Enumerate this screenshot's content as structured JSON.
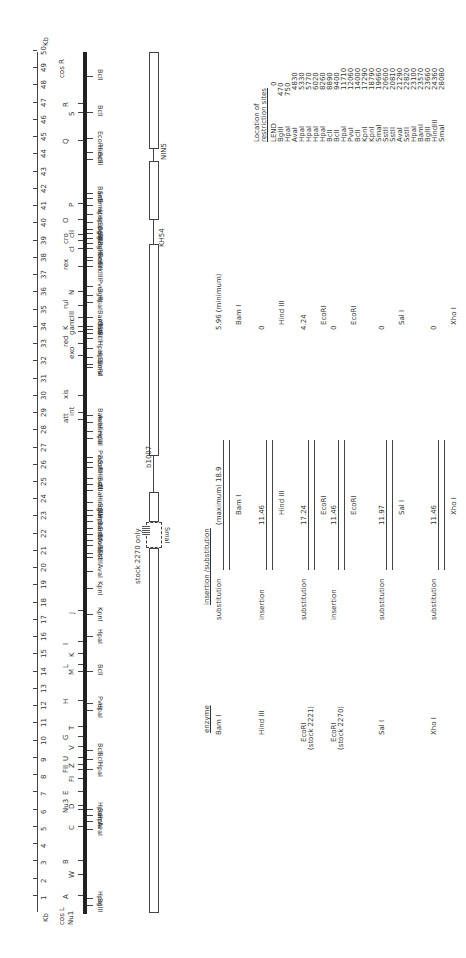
{
  "scale": {
    "unit_top": "Kb",
    "unit_bottom": "Kb",
    "ticks": [
      "1",
      "2",
      "3",
      "4",
      "5",
      "6",
      "7",
      "8",
      "9",
      "10",
      "11",
      "12",
      "13",
      "14",
      "15",
      "16",
      "17",
      "18",
      "19",
      "20",
      "21",
      "22",
      "23",
      "24",
      "25",
      "26",
      "27",
      "28",
      "29",
      "30",
      "31",
      "32",
      "33",
      "34",
      "35",
      "36",
      "37",
      "38",
      "39",
      "40",
      "41",
      "42",
      "43",
      "44",
      "45",
      "46",
      "47",
      "48",
      "49",
      "50"
    ]
  },
  "map": {
    "left_labels": [
      "cos L",
      "Nu1"
    ],
    "right_label": "cos R",
    "genes": [
      {
        "label": "A",
        "kb": 1.0
      },
      {
        "label": "W",
        "kb": 2.2
      },
      {
        "label": "B",
        "kb": 3.0
      },
      {
        "label": "C",
        "kb": 5.0
      },
      {
        "label": "Nu3",
        "kb": 6.0
      },
      {
        "label": "D",
        "kb": 6.2
      },
      {
        "label": "E",
        "kb": 7.0
      },
      {
        "label": "FI",
        "kb": 7.8
      },
      {
        "label": "FII",
        "kb": 8.3
      },
      {
        "label": "Z",
        "kb": 8.6
      },
      {
        "label": "U",
        "kb": 9.0
      },
      {
        "label": "V",
        "kb": 9.6
      },
      {
        "label": "G",
        "kb": 10.2
      },
      {
        "label": "T",
        "kb": 10.8
      },
      {
        "label": "H",
        "kb": 12.3
      },
      {
        "label": "M",
        "kb": 14.0
      },
      {
        "label": "L",
        "kb": 14.4
      },
      {
        "label": "K",
        "kb": 15.0
      },
      {
        "label": "I",
        "kb": 15.7
      },
      {
        "label": "J",
        "kb": 17.5
      },
      {
        "label": "att",
        "kb": 28.6
      },
      {
        "label": "int",
        "kb": 29.0
      },
      {
        "label": "xis",
        "kb": 30.0
      },
      {
        "label": "exo",
        "kb": 32.3
      },
      {
        "label": "red",
        "kb": 33.0
      },
      {
        "label": "gam",
        "kb": 33.7
      },
      {
        "label": "K",
        "kb": 34.0
      },
      {
        "label": "cIII",
        "kb": 34.5
      },
      {
        "label": "rul",
        "kb": 35.2
      },
      {
        "label": "N",
        "kb": 36.0
      },
      {
        "label": "rex",
        "kb": 37.5
      },
      {
        "label": "cI",
        "kb": 38.5
      },
      {
        "label": "cro",
        "kb": 39.0
      },
      {
        "label": "cII",
        "kb": 39.3
      },
      {
        "label": "O",
        "kb": 40.2
      },
      {
        "label": "P",
        "kb": 41.1
      },
      {
        "label": "Q",
        "kb": 44.8
      },
      {
        "label": "S",
        "kb": 46.4
      },
      {
        "label": "R",
        "kb": 46.9
      }
    ],
    "sites": [
      {
        "label": "BglII",
        "kb": 0.4
      },
      {
        "label": "HpaI",
        "kb": 0.8
      },
      {
        "label": "AvaI",
        "kb": 4.8
      },
      {
        "label": "HpaI",
        "kb": 5.3
      },
      {
        "label": "BamI",
        "kb": 5.6
      },
      {
        "label": "HpaI",
        "kb": 6.0
      },
      {
        "label": "HpaI",
        "kb": 8.3
      },
      {
        "label": "BclI",
        "kb": 8.9
      },
      {
        "label": "BclI",
        "kb": 9.4
      },
      {
        "label": "HpaI",
        "kb": 11.7
      },
      {
        "label": "PvuI",
        "kb": 12.1
      },
      {
        "label": "BclI",
        "kb": 14.0
      },
      {
        "label": "HpaI",
        "kb": 16.0
      },
      {
        "label": "KpnI",
        "kb": 17.3
      },
      {
        "label": "KpnI",
        "kb": 18.8
      },
      {
        "label": "AvaI",
        "kb": 19.8
      },
      {
        "label": "SstII",
        "kb": 20.6
      },
      {
        "label": "SstII",
        "kb": 20.8
      },
      {
        "label": "AvaI",
        "kb": 21.3
      },
      {
        "label": "EcoRI",
        "kb": 21.6
      },
      {
        "label": "SstII",
        "kb": 21.9
      },
      {
        "label": "BamI",
        "kb": 22.3
      },
      {
        "label": "HpaI",
        "kb": 22.7
      },
      {
        "label": "BamI",
        "kb": 23.0
      },
      {
        "label": "BglII",
        "kb": 23.3
      },
      {
        "label": "HindIII",
        "kb": 23.8
      },
      {
        "label": "XbaI",
        "kb": 24.5
      },
      {
        "label": "SstI",
        "kb": 24.8
      },
      {
        "label": "HindIII",
        "kb": 25.2
      },
      {
        "label": "SstI",
        "kb": 25.8
      },
      {
        "label": "EcoRI",
        "kb": 26.1
      },
      {
        "label": "PvuI",
        "kb": 26.4
      },
      {
        "label": "HpaI",
        "kb": 27.5
      },
      {
        "label": "HindIII",
        "kb": 27.9
      },
      {
        "label": "AvaI",
        "kb": 28.4
      },
      {
        "label": "BamI",
        "kb": 28.8
      },
      {
        "label": "SmaI",
        "kb": 31.6
      },
      {
        "label": "EcoRI",
        "kb": 31.8
      },
      {
        "label": "HpaI",
        "kb": 32.2
      },
      {
        "label": "HpaI",
        "kb": 32.7
      },
      {
        "label": "BclI",
        "kb": 33.3
      },
      {
        "label": "SalI",
        "kb": 33.6
      },
      {
        "label": "SstI",
        "kb": 33.8
      },
      {
        "label": "XhoI",
        "kb": 34.0
      },
      {
        "label": "BamI",
        "kb": 34.5
      },
      {
        "label": "HpaI",
        "kb": 35.4
      },
      {
        "label": "BglII",
        "kb": 35.8
      },
      {
        "label": "PvuI",
        "kb": 36.3
      },
      {
        "label": "HindIII",
        "kb": 37.5
      },
      {
        "label": "BclI",
        "kb": 37.8
      },
      {
        "label": "HindIII",
        "kb": 38.0
      },
      {
        "label": "BglII",
        "kb": 38.5
      },
      {
        "label": "AvaI",
        "kb": 38.8
      },
      {
        "label": "BglII",
        "kb": 39.1
      },
      {
        "label": "BglII",
        "kb": 39.4
      },
      {
        "label": "EcoRI",
        "kb": 39.6
      },
      {
        "label": "HpaI",
        "kb": 40.0
      },
      {
        "label": "HpaI",
        "kb": 40.5
      },
      {
        "label": "SmaI",
        "kb": 41.0
      },
      {
        "label": "SstI",
        "kb": 41.4
      },
      {
        "label": "BamI",
        "kb": 41.7
      },
      {
        "label": "BclI",
        "kb": 43.7
      },
      {
        "label": "HindIII",
        "kb": 44.1
      },
      {
        "label": "EcoRI",
        "kb": 44.9
      },
      {
        "label": "BclI",
        "kb": 46.4
      },
      {
        "label": "BclI",
        "kb": 48.5
      }
    ]
  },
  "deletions": {
    "labels": [
      "b1007",
      "KH54",
      "NIN5"
    ],
    "stock_note": "stock 2270 only",
    "smai_label": "SmaI"
  },
  "site_table": {
    "title_line1": "Location of",
    "title_line2": "restriction sites",
    "rows": [
      [
        "LEND",
        "0"
      ],
      [
        "BglII",
        "470"
      ],
      [
        "HpaI",
        "750"
      ],
      [
        "AvaI",
        "4830"
      ],
      [
        "HpaI",
        "5330"
      ],
      [
        "HpaI",
        "5770"
      ],
      [
        "HpaI",
        "6020"
      ],
      [
        "HpaI",
        "8260"
      ],
      [
        "BclI",
        "8890"
      ],
      [
        "BclI",
        "9400"
      ],
      [
        "HpaI",
        "11710"
      ],
      [
        "PvuI",
        "12060"
      ],
      [
        "BclI",
        "14000"
      ],
      [
        "KpnI",
        "17290"
      ],
      [
        "KpnI",
        "18790"
      ],
      [
        "SmaI",
        "19660"
      ],
      [
        "SstII",
        "20600"
      ],
      [
        "SstII",
        "20810"
      ],
      [
        "AvaI",
        "21290"
      ],
      [
        "SstII",
        "22820"
      ],
      [
        "HpaI",
        "23100"
      ],
      [
        "BamI",
        "23570"
      ],
      [
        "BglII",
        "23660"
      ],
      [
        "HindIII",
        "24360"
      ],
      [
        "SmaI",
        "28080"
      ]
    ]
  },
  "insertion_table": {
    "header_enzyme": "enzyme",
    "header_type": "insertion /substitution",
    "rows": [
      {
        "enzyme": "Bam I",
        "type": "substitution",
        "left_val": "(maximum) 18.9",
        "right_val": "5.96 (minimum)",
        "site_left": "Bam I",
        "site_right": "Bam I"
      },
      {
        "enzyme": "Hind III",
        "type": "insertion",
        "left_val": "11.46",
        "right_val": "0",
        "site_left": "Hind III",
        "site_right": "Hind III"
      },
      {
        "enzyme": "EcoRI (stock 2221)",
        "enzyme_l1": "EcoRI",
        "enzyme_l2": "(stock 2221)",
        "type": "substitution",
        "left_val": "17.24",
        "right_val": "4.24",
        "site_left": "EcoRI",
        "site_right": "EcoRI"
      },
      {
        "enzyme": "EcoRI (stock 2270)",
        "enzyme_l1": "EcoRI",
        "enzyme_l2": "(stock 2270)",
        "type": "insertion",
        "left_val": "11.46",
        "right_val": "0",
        "site_left": "EcoRI",
        "site_right": "EcoRI"
      },
      {
        "enzyme": "Sal I",
        "type": "substitution",
        "left_val": "11.97",
        "right_val": "0",
        "site_left": "Sal I",
        "site_right": "Sal I"
      },
      {
        "enzyme": "Xho I",
        "type": "substitution",
        "left_val": "11.46",
        "right_val": "0",
        "site_left": "Xho I",
        "site_right": "Xho I"
      }
    ]
  }
}
